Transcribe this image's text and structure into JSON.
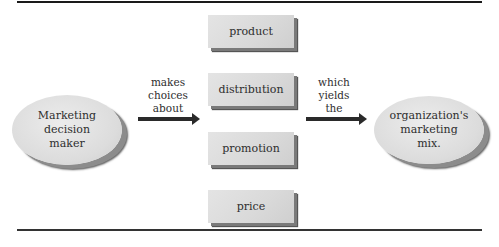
{
  "diagram": {
    "source_node": {
      "label_lines": [
        "Marketing",
        "decision",
        "maker"
      ]
    },
    "left_connector": {
      "label_lines": [
        "makes",
        "choices",
        "about"
      ]
    },
    "choices": [
      {
        "label": "product"
      },
      {
        "label": "distribution"
      },
      {
        "label": "promotion"
      },
      {
        "label": "price"
      }
    ],
    "right_connector": {
      "label_lines": [
        "which",
        "yields",
        "the"
      ]
    },
    "result_node": {
      "label_lines": [
        "organization's",
        "marketing",
        "mix."
      ]
    }
  }
}
